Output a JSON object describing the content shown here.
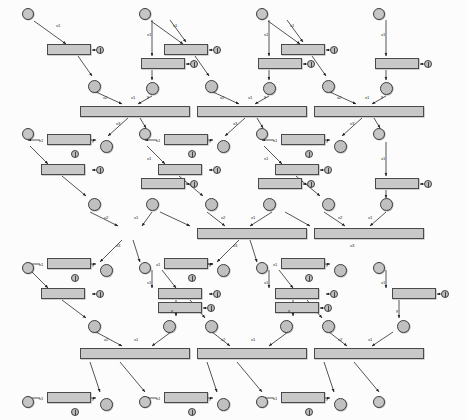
{
  "diagram": {
    "grid_label_prefix": "",
    "colors": {
      "node_fill": "#c8c8c8",
      "node_stroke": "#4a4a4a",
      "edge": "#2b2b2b",
      "background": "#ffffff"
    },
    "formulas": {
      "inc": "y=x1+1.0",
      "zero": "y=x1+0.0",
      "min3": "y=Math.min(x1,Math.min(x2,x3))"
    },
    "edge_labels": {
      "x1": "x1",
      "x2": "x2",
      "x3": "x3",
      "y": "y"
    },
    "grid_nodes": [
      {
        "id": "g00",
        "label": "(0,0)",
        "x": 22,
        "y": 8
      },
      {
        "id": "g01",
        "label": "(0,1)",
        "x": 139,
        "y": 8
      },
      {
        "id": "g02",
        "label": "(0,2)",
        "x": 256,
        "y": 8
      },
      {
        "id": "g03",
        "label": "(0,3)",
        "x": 373,
        "y": 8
      },
      {
        "id": "g10",
        "label": "(1,0)",
        "x": 22,
        "y": 128
      },
      {
        "id": "g11",
        "label": "(1,1)",
        "x": 139,
        "y": 128
      },
      {
        "id": "g12",
        "label": "(1,2)",
        "x": 256,
        "y": 128
      },
      {
        "id": "g13",
        "label": "(1,3)",
        "x": 373,
        "y": 128
      },
      {
        "id": "g20",
        "label": "(2,0)",
        "x": 22,
        "y": 262
      },
      {
        "id": "g21",
        "label": "(2,1)",
        "x": 139,
        "y": 262
      },
      {
        "id": "g22",
        "label": "(2,2)",
        "x": 256,
        "y": 262
      },
      {
        "id": "g23",
        "label": "(2,3)",
        "x": 373,
        "y": 262
      },
      {
        "id": "g30",
        "label": "(3,0)",
        "x": 22,
        "y": 396
      },
      {
        "id": "g31",
        "label": "(3,1)",
        "x": 139,
        "y": 396
      },
      {
        "id": "g32",
        "label": "(3,2)",
        "x": 256,
        "y": 396
      },
      {
        "id": "g33",
        "label": "(3,3)",
        "x": 373,
        "y": 396
      }
    ],
    "min_nodes": [
      {
        "id": "m8",
        "label": "m8",
        "formula": "y=Math.min(x1,Math.min(x2,x3))",
        "x": 80,
        "y": 106
      },
      {
        "id": "m7",
        "label": "m7",
        "formula": "y=Math.min(x1,Math.min(x2,x3))",
        "x": 80,
        "y": 348
      },
      {
        "id": "m6",
        "label": "m6",
        "formula": "y=Math.min(x1,Math.min(x2,x3))",
        "x": 197,
        "y": 106
      },
      {
        "id": "m5",
        "label": "m5",
        "formula": "y=Math.min(x1,Math.min(x2,x3))",
        "x": 314,
        "y": 106
      },
      {
        "id": "m4",
        "label": "m4",
        "formula": "y=Math.min(x1,Math.min(x2,x3))",
        "x": 197,
        "y": 228
      },
      {
        "id": "m3",
        "label": "m3",
        "formula": "y=Math.min(x1,Math.min(x2,x3))",
        "x": 197,
        "y": 348
      },
      {
        "id": "m2",
        "label": "m2",
        "formula": "y=Math.min(x1,Math.min(x2,x3))",
        "x": 314,
        "y": 228
      },
      {
        "id": "m1",
        "label": "m1",
        "formula": "y=Math.min(x1,Math.min(x2,x3))",
        "x": 314,
        "y": 348
      }
    ],
    "transitions": [
      {
        "id": "st27",
        "label": "st27",
        "formula": "y=x1+1.0",
        "x": 47,
        "y": 44
      },
      {
        "id": "st26",
        "label": "st26",
        "formula": "y=x1+1.0",
        "x": 47,
        "y": 134
      },
      {
        "id": "st25",
        "label": "st25",
        "formula": "y=x1+1.0",
        "x": 141,
        "y": 58
      },
      {
        "id": "st24",
        "label": "st24",
        "formula": "y=x1+0.0",
        "x": 41,
        "y": 164
      },
      {
        "id": "st23",
        "label": "st23",
        "formula": "y=x1+1.0",
        "x": 47,
        "y": 258
      },
      {
        "id": "st22",
        "label": "st22",
        "formula": "y=x1+1.0",
        "x": 141,
        "y": 178
      },
      {
        "id": "st21",
        "label": "st21",
        "formula": "y=x1+1.0",
        "x": 41,
        "y": 288
      },
      {
        "id": "st20",
        "label": "st20",
        "formula": "y=x1+1.0",
        "x": 47,
        "y": 392
      },
      {
        "id": "st19",
        "label": "st19",
        "formula": "y=x1+1.0",
        "x": 158,
        "y": 302
      },
      {
        "id": "st18",
        "label": "st18",
        "formula": "y=x1+1.0",
        "x": 164,
        "y": 44
      },
      {
        "id": "st17",
        "label": "st17",
        "formula": "y=x1+1.0",
        "x": 164,
        "y": 134
      },
      {
        "id": "st16",
        "label": "st16",
        "formula": "y=x1+1.0",
        "x": 258,
        "y": 58
      },
      {
        "id": "st15",
        "label": "st15",
        "formula": "y=x1+1.0",
        "x": 281,
        "y": 44
      },
      {
        "id": "st14",
        "label": "st14",
        "formula": "y=x1+1.0",
        "x": 281,
        "y": 134
      },
      {
        "id": "st13",
        "label": "st13",
        "formula": "y=x1+1.0",
        "x": 375,
        "y": 58
      },
      {
        "id": "st12",
        "label": "st12",
        "formula": "y=x1+1.0",
        "x": 158,
        "y": 164
      },
      {
        "id": "st11",
        "label": "st11",
        "formula": "y=x1+1.0",
        "x": 164,
        "y": 258
      },
      {
        "id": "st10",
        "label": "st10",
        "formula": "y=x1+1.0",
        "x": 258,
        "y": 178
      },
      {
        "id": "st9",
        "label": "st9",
        "formula": "y=x1+0.0",
        "x": 158,
        "y": 288
      },
      {
        "id": "st8",
        "label": "st8",
        "formula": "y=x1+1.0",
        "x": 164,
        "y": 392
      },
      {
        "id": "st7",
        "label": "st7",
        "formula": "y=x1+1.0",
        "x": 275,
        "y": 302
      },
      {
        "id": "st6",
        "label": "st6",
        "formula": "y=x1+1.0",
        "x": 275,
        "y": 164
      },
      {
        "id": "st5",
        "label": "st5",
        "formula": "y=x1+1.0",
        "x": 281,
        "y": 258
      },
      {
        "id": "st4",
        "label": "st4",
        "formula": "y=x1+1.0",
        "x": 375,
        "y": 178
      },
      {
        "id": "st3",
        "label": "st3",
        "formula": "y=x1+0.0",
        "x": 275,
        "y": 288
      },
      {
        "id": "st2",
        "label": "st2",
        "formula": "y=x1+1.0",
        "x": 281,
        "y": 392
      },
      {
        "id": "st1",
        "label": "st1",
        "formula": "y=x1+1.0",
        "x": 392,
        "y": 288
      }
    ],
    "places": [
      {
        "id": "p27",
        "label": "p27",
        "x": 88,
        "y": 80
      },
      {
        "id": "p26",
        "label": "p26",
        "x": 100,
        "y": 140
      },
      {
        "id": "p25",
        "label": "p25",
        "x": 146,
        "y": 82
      },
      {
        "id": "p24",
        "label": "p24",
        "x": 88,
        "y": 198
      },
      {
        "id": "p23",
        "label": "p23",
        "x": 100,
        "y": 264
      },
      {
        "id": "p22",
        "label": "p22",
        "x": 146,
        "y": 198
      },
      {
        "id": "p21",
        "label": "p21",
        "x": 88,
        "y": 320
      },
      {
        "id": "p20",
        "label": "p20",
        "x": 100,
        "y": 398
      },
      {
        "id": "p19",
        "label": "p19",
        "x": 163,
        "y": 320
      },
      {
        "id": "p18",
        "label": "p18",
        "x": 205,
        "y": 80
      },
      {
        "id": "p17",
        "label": "p17",
        "x": 217,
        "y": 140
      },
      {
        "id": "p16",
        "label": "p16",
        "x": 263,
        "y": 82
      },
      {
        "id": "p15",
        "label": "p15",
        "x": 205,
        "y": 198
      },
      {
        "id": "p14",
        "label": "p14",
        "x": 217,
        "y": 264
      },
      {
        "id": "p13",
        "label": "p13",
        "x": 263,
        "y": 198
      },
      {
        "id": "p12",
        "label": "p12",
        "x": 205,
        "y": 320
      },
      {
        "id": "p11",
        "label": "p11",
        "x": 217,
        "y": 398
      },
      {
        "id": "p10",
        "label": "p10",
        "x": 280,
        "y": 320
      },
      {
        "id": "p9",
        "label": "p9",
        "x": 322,
        "y": 80
      },
      {
        "id": "p8",
        "label": "p8",
        "x": 334,
        "y": 140
      },
      {
        "id": "p7",
        "label": "p7",
        "x": 380,
        "y": 82
      },
      {
        "id": "p6",
        "label": "p6",
        "x": 322,
        "y": 198
      },
      {
        "id": "p5",
        "label": "p5",
        "x": 334,
        "y": 264
      },
      {
        "id": "p4",
        "label": "p4",
        "x": 380,
        "y": 198
      },
      {
        "id": "p3",
        "label": "p3",
        "x": 322,
        "y": 320
      },
      {
        "id": "p2",
        "label": "p2",
        "x": 334,
        "y": 398
      },
      {
        "id": "p1",
        "label": "p1",
        "x": 397,
        "y": 320
      }
    ],
    "ep_nodes": [
      {
        "id": "ep27",
        "label": "ep27",
        "x": 96,
        "y": 46
      },
      {
        "id": "ep26",
        "label": "ep26",
        "x": 71,
        "y": 150
      },
      {
        "id": "ep25",
        "label": "ep25",
        "x": 190,
        "y": 60
      },
      {
        "id": "ep24",
        "label": "ep24",
        "x": 96,
        "y": 166
      },
      {
        "id": "ep23",
        "label": "ep23",
        "x": 71,
        "y": 274
      },
      {
        "id": "ep22",
        "label": "ep22",
        "x": 190,
        "y": 180
      },
      {
        "id": "ep21",
        "label": "ep21",
        "x": 96,
        "y": 290
      },
      {
        "id": "ep20",
        "label": "ep20",
        "x": 71,
        "y": 408
      },
      {
        "id": "ep19",
        "label": "ep19",
        "x": 207,
        "y": 304
      },
      {
        "id": "ep18",
        "label": "ep18",
        "x": 213,
        "y": 46
      },
      {
        "id": "ep17",
        "label": "ep17",
        "x": 188,
        "y": 150
      },
      {
        "id": "ep16",
        "label": "ep16",
        "x": 307,
        "y": 60
      },
      {
        "id": "ep15",
        "label": "ep15",
        "x": 330,
        "y": 46
      },
      {
        "id": "ep14",
        "label": "ep14",
        "x": 305,
        "y": 150
      },
      {
        "id": "ep13",
        "label": "ep13",
        "x": 424,
        "y": 60
      },
      {
        "id": "ep12",
        "label": "ep12",
        "x": 213,
        "y": 166
      },
      {
        "id": "ep11",
        "label": "ep11",
        "x": 188,
        "y": 274
      },
      {
        "id": "ep10",
        "label": "ep10",
        "x": 307,
        "y": 180
      },
      {
        "id": "ep9",
        "label": "ep9",
        "x": 213,
        "y": 290
      },
      {
        "id": "ep8",
        "label": "ep8",
        "x": 188,
        "y": 408
      },
      {
        "id": "ep7",
        "label": "ep7",
        "x": 324,
        "y": 304
      },
      {
        "id": "ep6",
        "label": "ep6",
        "x": 324,
        "y": 166
      },
      {
        "id": "ep5",
        "label": "ep5",
        "x": 305,
        "y": 274
      },
      {
        "id": "ep4",
        "label": "ep4",
        "x": 424,
        "y": 180
      },
      {
        "id": "ep3",
        "label": "ep3",
        "x": 330,
        "y": 290
      },
      {
        "id": "ep2",
        "label": "ep2",
        "x": 305,
        "y": 408
      },
      {
        "id": "ep1",
        "label": "ep1",
        "x": 441,
        "y": 290
      }
    ]
  }
}
